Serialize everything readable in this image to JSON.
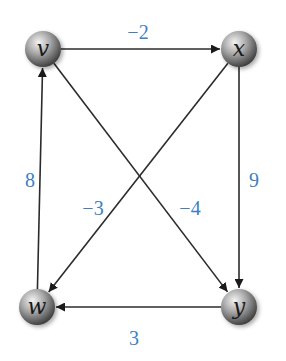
{
  "graph": {
    "type": "directed-weighted-graph",
    "colors": {
      "edge": "#2b2b2b",
      "weight_label": "#3d7fc4",
      "node_light": "#f2f2f2",
      "node_dark": "#4a4a4a"
    },
    "nodes": [
      {
        "id": "v",
        "label": "v",
        "x": 43,
        "y": 49
      },
      {
        "id": "x",
        "label": "x",
        "x": 239,
        "y": 49
      },
      {
        "id": "w",
        "label": "w",
        "x": 37,
        "y": 307
      },
      {
        "id": "y",
        "label": "y",
        "x": 239,
        "y": 307
      }
    ],
    "edges": [
      {
        "from": "v",
        "to": "x",
        "weight": "−2",
        "label_x": 138,
        "label_y": 32
      },
      {
        "from": "x",
        "to": "y",
        "weight": "9",
        "label_x": 254,
        "label_y": 180
      },
      {
        "from": "x",
        "to": "w",
        "weight": "−3",
        "label_x": 93,
        "label_y": 208
      },
      {
        "from": "v",
        "to": "y",
        "weight": "−4",
        "label_x": 190,
        "label_y": 208
      },
      {
        "from": "y",
        "to": "w",
        "weight": "3",
        "label_x": 134,
        "label_y": 338
      },
      {
        "from": "w",
        "to": "v",
        "weight": "8",
        "label_x": 30,
        "label_y": 180
      }
    ]
  }
}
